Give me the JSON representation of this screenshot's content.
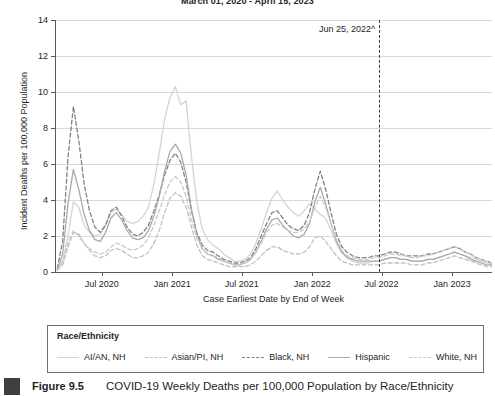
{
  "figure": {
    "number": "Figure 9.5",
    "caption": "COVID-19 Weekly Deaths per 100,000 Population by Race/Ethnicity"
  },
  "annotation": {
    "label": "Jun 25, 2022^",
    "x_value": "2022-06-25"
  },
  "legend": {
    "title": "Race/Ethnicity"
  },
  "chart_data": {
    "type": "line",
    "title": "March 01, 2020 - April 15, 2023",
    "xlabel": "Case Earliest Date by End of Week",
    "ylabel": "Incident Deaths per 100,000 Population",
    "ylim": [
      0,
      14
    ],
    "yticks": [
      0,
      2,
      4,
      6,
      8,
      10,
      12,
      14
    ],
    "xlim": [
      "2020-03-01",
      "2023-04-15"
    ],
    "xticks": [
      "Jul 2020",
      "Jan 2021",
      "Jul 2021",
      "Jan 2022",
      "Jul 2022",
      "Jan 2023"
    ],
    "xtick_values": [
      "2020-07-01",
      "2021-01-01",
      "2021-07-01",
      "2022-01-01",
      "2022-07-01",
      "2023-01-01"
    ],
    "grid": true,
    "legend_position": "below-plot",
    "x": [
      "2020-03-07",
      "2020-03-21",
      "2020-04-04",
      "2020-04-18",
      "2020-05-02",
      "2020-05-16",
      "2020-05-30",
      "2020-06-13",
      "2020-06-27",
      "2020-07-11",
      "2020-07-25",
      "2020-08-08",
      "2020-08-22",
      "2020-09-05",
      "2020-09-19",
      "2020-10-03",
      "2020-10-17",
      "2020-10-31",
      "2020-11-14",
      "2020-11-28",
      "2020-12-12",
      "2020-12-26",
      "2021-01-09",
      "2021-01-23",
      "2021-02-06",
      "2021-02-20",
      "2021-03-06",
      "2021-03-20",
      "2021-04-03",
      "2021-04-17",
      "2021-05-01",
      "2021-05-15",
      "2021-05-29",
      "2021-06-12",
      "2021-06-26",
      "2021-07-10",
      "2021-07-24",
      "2021-08-07",
      "2021-08-21",
      "2021-09-04",
      "2021-09-18",
      "2021-10-02",
      "2021-10-16",
      "2021-10-30",
      "2021-11-13",
      "2021-11-27",
      "2021-12-11",
      "2021-12-25",
      "2022-01-08",
      "2022-01-22",
      "2022-02-05",
      "2022-02-19",
      "2022-03-05",
      "2022-03-19",
      "2022-04-02",
      "2022-04-16",
      "2022-04-30",
      "2022-05-14",
      "2022-05-28",
      "2022-06-11",
      "2022-06-25",
      "2022-07-09",
      "2022-07-23",
      "2022-08-06",
      "2022-08-20",
      "2022-09-03",
      "2022-09-17",
      "2022-10-01",
      "2022-10-15",
      "2022-10-29",
      "2022-11-12",
      "2022-11-26",
      "2022-12-10",
      "2022-12-24",
      "2023-01-07",
      "2023-01-21",
      "2023-02-04",
      "2023-02-18",
      "2023-03-04",
      "2023-03-18",
      "2023-04-01",
      "2023-04-15"
    ],
    "series": [
      {
        "name": "AI/AN, NH",
        "style": "solid",
        "color": "#d3d4d5",
        "values": [
          0.1,
          0.6,
          2.0,
          3.9,
          3.6,
          2.6,
          2.2,
          2.0,
          2.1,
          2.6,
          3.3,
          3.5,
          3.2,
          2.8,
          2.7,
          2.8,
          3.1,
          3.6,
          4.9,
          6.6,
          8.5,
          9.7,
          10.3,
          9.3,
          9.5,
          6.4,
          3.9,
          2.4,
          1.8,
          1.5,
          1.3,
          1.0,
          0.8,
          0.6,
          0.6,
          0.7,
          1.0,
          1.6,
          2.4,
          3.3,
          4.1,
          4.5,
          4.0,
          3.6,
          3.3,
          3.1,
          3.4,
          3.8,
          3.5,
          3.2,
          3.0,
          2.3,
          1.6,
          1.1,
          0.8,
          0.6,
          0.5,
          0.5,
          0.5,
          0.6,
          0.6,
          0.7,
          0.8,
          0.8,
          0.7,
          0.7,
          0.6,
          0.6,
          0.6,
          0.7,
          0.7,
          0.8,
          0.9,
          1.0,
          1.1,
          1.0,
          0.9,
          0.8,
          0.7,
          0.6,
          0.5,
          0.4
        ]
      },
      {
        "name": "Asian/PI, NH",
        "style": "dashed",
        "color": "#bfc0c2",
        "values": [
          0.1,
          0.4,
          1.4,
          2.2,
          2.1,
          1.6,
          1.2,
          0.9,
          0.8,
          0.9,
          1.2,
          1.3,
          1.2,
          1.0,
          0.8,
          0.8,
          0.9,
          1.1,
          1.6,
          2.3,
          3.3,
          4.1,
          4.4,
          4.2,
          3.6,
          2.5,
          1.5,
          0.9,
          0.7,
          0.6,
          0.5,
          0.4,
          0.3,
          0.3,
          0.3,
          0.3,
          0.4,
          0.6,
          0.9,
          1.2,
          1.4,
          1.4,
          1.2,
          1.1,
          1.0,
          1.0,
          1.1,
          1.4,
          1.9,
          2.0,
          1.7,
          1.3,
          0.9,
          0.6,
          0.5,
          0.4,
          0.4,
          0.4,
          0.4,
          0.4,
          0.4,
          0.5,
          0.5,
          0.5,
          0.5,
          0.5,
          0.4,
          0.4,
          0.4,
          0.5,
          0.5,
          0.6,
          0.7,
          0.8,
          0.9,
          0.8,
          0.7,
          0.6,
          0.5,
          0.4,
          0.3,
          0.3
        ]
      },
      {
        "name": "Black, NH",
        "style": "dashed",
        "color": "#808285",
        "values": [
          0.2,
          1.7,
          6.4,
          9.2,
          7.3,
          4.9,
          3.4,
          2.5,
          2.2,
          2.6,
          3.4,
          3.6,
          3.1,
          2.5,
          2.1,
          2.0,
          2.2,
          2.6,
          3.4,
          4.3,
          5.4,
          6.2,
          6.6,
          6.1,
          5.0,
          3.4,
          2.2,
          1.5,
          1.2,
          1.1,
          0.9,
          0.7,
          0.6,
          0.5,
          0.5,
          0.6,
          0.8,
          1.3,
          2.0,
          2.7,
          3.3,
          3.4,
          3.0,
          2.6,
          2.4,
          2.3,
          2.6,
          3.3,
          4.6,
          5.6,
          4.6,
          3.3,
          2.1,
          1.4,
          1.1,
          0.9,
          0.8,
          0.8,
          0.8,
          0.9,
          0.9,
          1.0,
          1.1,
          1.1,
          1.0,
          0.9,
          0.9,
          0.9,
          0.9,
          1.0,
          1.0,
          1.1,
          1.2,
          1.3,
          1.4,
          1.3,
          1.1,
          1.0,
          0.8,
          0.7,
          0.6,
          0.5
        ]
      },
      {
        "name": "Hispanic",
        "style": "solid",
        "color": "#a7a9ac",
        "values": [
          0.1,
          1.0,
          3.8,
          5.7,
          4.6,
          3.2,
          2.3,
          1.8,
          1.7,
          2.2,
          3.0,
          3.3,
          2.9,
          2.3,
          1.9,
          1.8,
          1.9,
          2.3,
          3.1,
          4.2,
          5.6,
          6.7,
          7.1,
          6.6,
          5.4,
          3.5,
          2.1,
          1.3,
          1.0,
          0.9,
          0.7,
          0.6,
          0.5,
          0.4,
          0.4,
          0.5,
          0.7,
          1.1,
          1.7,
          2.4,
          2.9,
          3.0,
          2.6,
          2.3,
          2.0,
          1.9,
          2.1,
          2.7,
          3.9,
          4.7,
          3.8,
          2.7,
          1.7,
          1.1,
          0.8,
          0.7,
          0.6,
          0.6,
          0.6,
          0.6,
          0.6,
          0.7,
          0.8,
          0.8,
          0.7,
          0.7,
          0.6,
          0.6,
          0.6,
          0.7,
          0.7,
          0.8,
          0.9,
          1.0,
          1.1,
          1.0,
          0.9,
          0.7,
          0.6,
          0.5,
          0.4,
          0.4
        ]
      },
      {
        "name": "White, NH",
        "style": "dashed",
        "color": "#c9cacb",
        "values": [
          0.1,
          0.5,
          1.6,
          2.3,
          2.0,
          1.6,
          1.3,
          1.1,
          1.0,
          1.1,
          1.4,
          1.6,
          1.5,
          1.3,
          1.2,
          1.3,
          1.5,
          1.9,
          2.6,
          3.4,
          4.3,
          5.0,
          5.3,
          5.0,
          4.2,
          2.9,
          1.9,
          1.3,
          1.0,
          0.9,
          0.8,
          0.6,
          0.5,
          0.4,
          0.4,
          0.5,
          0.7,
          1.1,
          1.6,
          2.2,
          2.6,
          2.7,
          2.5,
          2.3,
          2.2,
          2.2,
          2.4,
          2.8,
          3.6,
          4.2,
          3.6,
          2.7,
          1.8,
          1.2,
          0.9,
          0.8,
          0.7,
          0.7,
          0.7,
          0.8,
          0.8,
          0.9,
          1.0,
          1.0,
          0.9,
          0.9,
          0.8,
          0.8,
          0.9,
          0.9,
          1.0,
          1.1,
          1.2,
          1.3,
          1.4,
          1.3,
          1.1,
          1.0,
          0.8,
          0.7,
          0.6,
          0.5
        ]
      }
    ]
  }
}
